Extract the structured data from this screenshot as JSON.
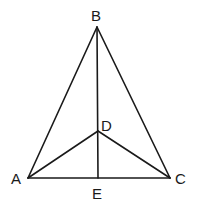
{
  "diagram": {
    "points": {
      "A": {
        "label": "A",
        "x": 28,
        "y": 178
      },
      "B": {
        "label": "B",
        "x": 97,
        "y": 27
      },
      "C": {
        "label": "C",
        "x": 170,
        "y": 178
      },
      "D": {
        "label": "D",
        "x": 98,
        "y": 131
      },
      "E": {
        "label": "E",
        "x": 98,
        "y": 178
      }
    },
    "segments": [
      "AB",
      "BC",
      "AC",
      "BE",
      "AD",
      "DC"
    ]
  }
}
